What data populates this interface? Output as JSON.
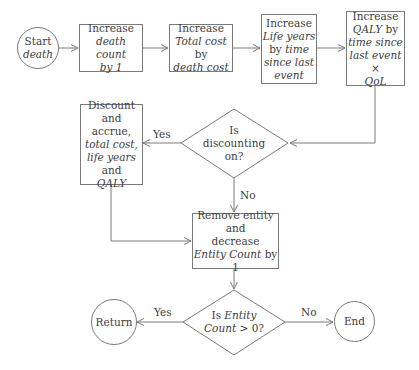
{
  "diagram": {
    "nodes": {
      "start": {
        "lines": [
          [
            "Start",
            ""
          ],
          [
            "",
            "death"
          ]
        ]
      },
      "inc_death": {
        "line1": "Increase",
        "line2_i": "death count",
        "line3_i": "by 1"
      },
      "inc_cost": {
        "line1": "Increase",
        "line2_i": "Total cost",
        "line2_n": " by",
        "line3_i": "death cost"
      },
      "inc_life": {
        "line1": "Increase",
        "line2_i": "Life years",
        "line3_n": "by ",
        "line3_i": "time",
        "line4_i": "since last",
        "line5_i": "event"
      },
      "inc_qaly": {
        "line1": "Increase",
        "line2_i": "QALY",
        "line2_n": " by",
        "line3_i": "time since",
        "line4_i": "last event",
        "line4_n": " ×",
        "line5_i": "QoL"
      },
      "discount_q": {
        "line1": "Is",
        "line2": "discounting",
        "line3": "on?"
      },
      "discount_box": {
        "line1": "Discount and",
        "line2": "accrue,",
        "line3_i": "total cost,",
        "line4_i": "life years",
        "line5": "and",
        "line6_i": "QALY"
      },
      "remove": {
        "line1": "Remove entity and",
        "line2": "decrease",
        "line3_i": "Entity Count",
        "line3_n": " by 1"
      },
      "count_q": {
        "line1_n": "Is ",
        "line1_i": "Entity",
        "line2_i": "Count",
        "line2_n": " > 0?"
      },
      "return": {
        "label": "Return"
      },
      "end": {
        "label": "End"
      }
    },
    "edge_labels": {
      "discount_yes": "Yes",
      "discount_no": "No",
      "count_yes": "Yes",
      "count_no": "No"
    },
    "colors": {
      "stroke": "#7a7a7a",
      "text": "#3d3d3d"
    }
  }
}
